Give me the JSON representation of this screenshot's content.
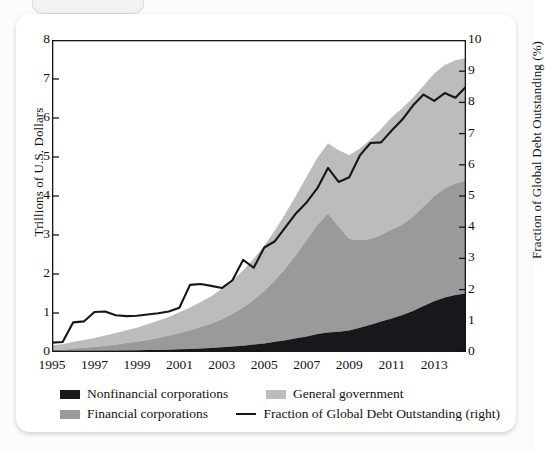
{
  "card": {
    "tab_label": ""
  },
  "chart_data": {
    "type": "area",
    "title": "",
    "subtitle": "",
    "stacked": true,
    "xlabel": "",
    "ylabel": "Trillions of U.S. Dollars",
    "ylabel_right": "Fraction of Global Debt Outstanding (%)",
    "xlim": [
      1995,
      2014.5
    ],
    "ylim": [
      0,
      8
    ],
    "ylim_right": [
      0,
      10
    ],
    "yticks": [
      0,
      1,
      2,
      3,
      4,
      5,
      6,
      7,
      8
    ],
    "yticks_right": [
      0,
      1,
      2,
      3,
      4,
      5,
      6,
      7,
      8,
      9,
      10
    ],
    "xticks": [
      1995,
      1997,
      1999,
      2001,
      2003,
      2005,
      2007,
      2009,
      2011,
      2013
    ],
    "grid": false,
    "legend_position": "below",
    "colors": {
      "nonfinancial": "#17171c",
      "financial": "#9a9a9a",
      "government": "#bcbcbc",
      "line": "#15151a",
      "frame": "#15151a",
      "card": "#ffffff",
      "page": "#fcfcfc"
    },
    "x": [
      1995,
      1995.5,
      1996,
      1996.5,
      1997,
      1997.5,
      1998,
      1998.5,
      1999,
      1999.5,
      2000,
      2000.5,
      2001,
      2001.5,
      2002,
      2002.5,
      2003,
      2003.5,
      2004,
      2004.5,
      2005,
      2005.5,
      2006,
      2006.5,
      2007,
      2007.5,
      2008,
      2008.5,
      2009,
      2009.5,
      2010,
      2010.5,
      2011,
      2011.5,
      2012,
      2012.5,
      2013,
      2013.5,
      2014,
      2014.5
    ],
    "series": [
      {
        "name": "Nonfinancial corporations",
        "color": "#17171c",
        "unit": "Trillions of U.S. Dollars",
        "axis": "left",
        "values": [
          0.01,
          0.01,
          0.02,
          0.02,
          0.02,
          0.03,
          0.03,
          0.04,
          0.04,
          0.05,
          0.05,
          0.06,
          0.07,
          0.08,
          0.09,
          0.1,
          0.12,
          0.14,
          0.16,
          0.19,
          0.22,
          0.26,
          0.3,
          0.35,
          0.4,
          0.46,
          0.5,
          0.52,
          0.55,
          0.62,
          0.7,
          0.78,
          0.86,
          0.95,
          1.05,
          1.18,
          1.3,
          1.4,
          1.46,
          1.5
        ]
      },
      {
        "name": "Financial corporations",
        "color": "#9a9a9a",
        "unit": "Trillions of U.S. Dollars",
        "axis": "left",
        "values": [
          0.04,
          0.05,
          0.07,
          0.09,
          0.11,
          0.13,
          0.16,
          0.19,
          0.22,
          0.26,
          0.31,
          0.36,
          0.42,
          0.48,
          0.55,
          0.63,
          0.72,
          0.84,
          0.98,
          1.15,
          1.35,
          1.58,
          1.85,
          2.15,
          2.48,
          2.8,
          3.05,
          2.7,
          2.35,
          2.25,
          2.2,
          2.22,
          2.28,
          2.32,
          2.42,
          2.55,
          2.7,
          2.8,
          2.86,
          2.9
        ]
      },
      {
        "name": "General government",
        "color": "#bcbcbc",
        "unit": "Trillions of U.S. Dollars",
        "axis": "left",
        "values": [
          0.12,
          0.14,
          0.17,
          0.2,
          0.23,
          0.26,
          0.3,
          0.33,
          0.36,
          0.4,
          0.44,
          0.48,
          0.53,
          0.58,
          0.64,
          0.7,
          0.78,
          0.86,
          0.95,
          1.05,
          1.16,
          1.28,
          1.4,
          1.52,
          1.62,
          1.72,
          1.8,
          1.95,
          2.15,
          2.35,
          2.55,
          2.72,
          2.88,
          2.98,
          3.05,
          3.1,
          3.14,
          3.16,
          3.16,
          3.14
        ]
      },
      {
        "name": "Fraction of Global Debt Outstanding (right)",
        "color": "#15151a",
        "unit": "%",
        "axis": "right",
        "type": "line",
        "values": [
          0.3,
          0.32,
          0.95,
          0.98,
          1.28,
          1.3,
          1.18,
          1.15,
          1.16,
          1.2,
          1.24,
          1.3,
          1.42,
          2.15,
          2.18,
          2.12,
          2.05,
          2.3,
          2.95,
          2.7,
          3.35,
          3.55,
          4.0,
          4.45,
          4.8,
          5.25,
          5.9,
          5.45,
          5.6,
          6.3,
          6.7,
          6.72,
          7.1,
          7.45,
          7.9,
          8.25,
          8.05,
          8.3,
          8.15,
          8.5
        ]
      }
    ],
    "legend": [
      {
        "label": "Nonfinancial corporations",
        "marker": "swatch",
        "color": "#17171c"
      },
      {
        "label": "General government",
        "marker": "swatch",
        "color": "#bcbcbc"
      },
      {
        "label": "Financial corporations",
        "marker": "swatch",
        "color": "#9a9a9a"
      },
      {
        "label": "Fraction of Global Debt Outstanding (right)",
        "marker": "line",
        "color": "#15151a"
      }
    ]
  }
}
